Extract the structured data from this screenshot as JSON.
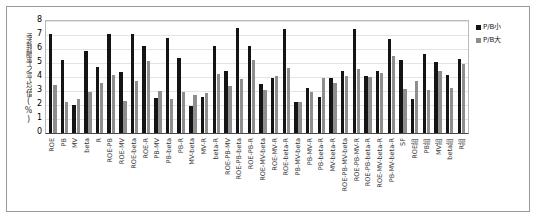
{
  "chart_data": {
    "type": "bar",
    "title": "",
    "subtitle": "",
    "xlabel": "",
    "ylabel": "季報酬率之平均值(%)",
    "ylim": [
      0,
      8
    ],
    "yticks": [
      0,
      1,
      2,
      3,
      4,
      5,
      6,
      7,
      8
    ],
    "grid": true,
    "legend_position": "right",
    "colors": {
      "series_0": "#141414",
      "series_1": "#8e8e8e",
      "plot_border": "#b9b9b9",
      "axis": "#4a4a4a",
      "gridline": "#e4e4e4",
      "frame": "#9a9a9a"
    },
    "categories": [
      "ROE",
      "PB",
      "MV",
      "beta",
      "R",
      "ROE-PB",
      "ROE-MV",
      "ROE-beta",
      "ROE-R",
      "PB-MV",
      "PB-beta",
      "PB-R",
      "MV-beta",
      "MV-R",
      "beta-R",
      "ROE-PB-MV",
      "ROE-PB-beta",
      "ROE-PB-R",
      "ROE-MV-beta",
      "ROE-MV-R",
      "ROE-beta-R",
      "PB-MV-beta",
      "PB-MV-R",
      "PB-beta-R",
      "MV-beta-R",
      "ROE-PB-MV-beta",
      "ROE-PB-MV-R",
      "ROE-PB-beta-R",
      "ROE-MV-beta-R",
      "PB-MV-beta-R",
      "SF",
      "ROE組",
      "PB組",
      "MV組",
      "beta組",
      "R組"
    ],
    "series": [
      {
        "name": "P/B小",
        "values": [
          7.1,
          5.2,
          2.0,
          5.85,
          4.75,
          7.05,
          4.35,
          7.05,
          6.2,
          2.5,
          6.8,
          5.35,
          1.9,
          2.6,
          6.2,
          4.4,
          7.5,
          6.25,
          3.5,
          3.9,
          7.45,
          2.2,
          3.25,
          2.6,
          3.95,
          4.4,
          7.4,
          4.05,
          4.4,
          6.7,
          5.2,
          2.45,
          5.65,
          5.05,
          4.15,
          5.3
        ]
      },
      {
        "name": "P/B大",
        "values": [
          3.4,
          2.2,
          2.4,
          2.95,
          3.6,
          4.15,
          2.3,
          3.75,
          5.15,
          3.0,
          2.4,
          2.95,
          2.75,
          2.85,
          4.2,
          3.35,
          3.85,
          5.25,
          3.05,
          4.05,
          4.65,
          2.25,
          2.9,
          3.9,
          3.55,
          4.1,
          4.6,
          4.0,
          4.3,
          5.5,
          3.15,
          3.7,
          3.05,
          4.4,
          3.2,
          4.9
        ]
      }
    ]
  },
  "legend": {
    "items": [
      {
        "label": "P/B小"
      },
      {
        "label": "P/B大"
      }
    ]
  }
}
